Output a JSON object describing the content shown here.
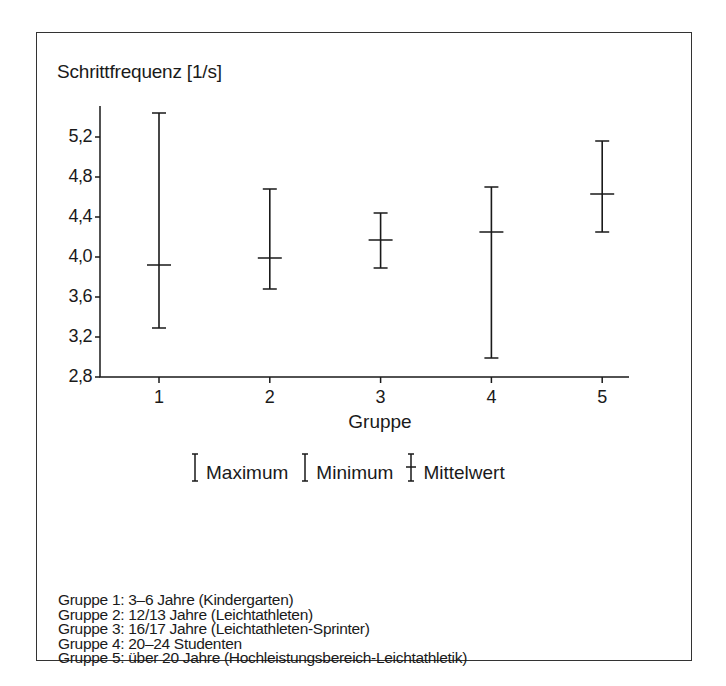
{
  "chart_data": {
    "type": "errorbar",
    "title": "Schrittfrequenz [1/s]",
    "xlabel": "Gruppe",
    "ylabel": "Schrittfrequenz [1/s]",
    "categories": [
      "1",
      "2",
      "3",
      "4",
      "5"
    ],
    "ylim": [
      2.8,
      5.45
    ],
    "yticks": [
      "2,8",
      "3,2",
      "3,6",
      "4,0",
      "4,4",
      "4,8",
      "5,2"
    ],
    "ytick_values": [
      2.8,
      3.2,
      3.6,
      4.0,
      4.4,
      4.8,
      5.2
    ],
    "series": [
      {
        "name": "Maximum",
        "values": [
          5.44,
          4.68,
          4.44,
          4.7,
          5.16
        ]
      },
      {
        "name": "Minimum",
        "values": [
          3.29,
          3.68,
          3.89,
          2.99,
          4.25
        ]
      },
      {
        "name": "Mittelwert",
        "values": [
          3.92,
          3.99,
          4.17,
          4.25,
          4.63
        ]
      }
    ],
    "legend": [
      "Maximum",
      "Minimum",
      "Mittelwert"
    ],
    "legend_position": "below",
    "grid": false
  },
  "legend": {
    "max_label": "Maximum",
    "min_label": "Minimum",
    "mean_label": "Mittelwert"
  },
  "groups": [
    "Gruppe 1: 3–6 Jahre (Kindergarten)",
    "Gruppe 2: 12/13 Jahre (Leichtathleten)",
    "Gruppe 3: 16/17 Jahre (Leichtathleten-Sprinter)",
    "Gruppe 4: 20–24 Studenten",
    "Gruppe 5: über 20 Jahre (Hochleistungsbereich-Leichtathletik)"
  ],
  "colors": {
    "line": "#1a1a1a",
    "frame": "#333333"
  }
}
